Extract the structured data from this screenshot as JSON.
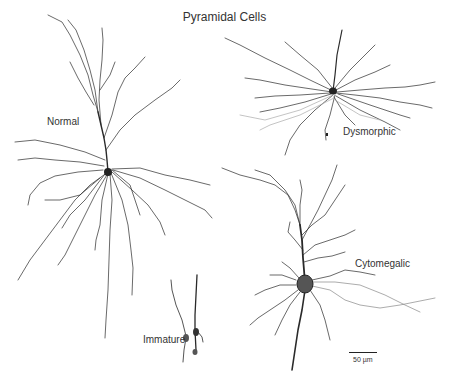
{
  "figure": {
    "title": "Pyramidal Cells",
    "background": "#ffffff",
    "ink_color": "#222222",
    "light_ink_color": "#999999"
  },
  "cells": [
    {
      "id": "normal",
      "label": "Normal",
      "label_pos": [
        47,
        122
      ],
      "soma": [
        108,
        172
      ]
    },
    {
      "id": "immature",
      "label": "Immature",
      "label_pos": [
        143,
        339
      ],
      "soma": [
        185,
        335
      ]
    },
    {
      "id": "dysmorphic",
      "label": "Dysmorphic",
      "label_pos": [
        343,
        131
      ],
      "soma": [
        333,
        91
      ]
    },
    {
      "id": "cytomegalic",
      "label": "Cytomegalic",
      "label_pos": [
        355,
        263
      ],
      "soma": [
        305,
        284
      ]
    }
  ],
  "scale_bar": {
    "label": "50 µm",
    "length_px": 28
  }
}
